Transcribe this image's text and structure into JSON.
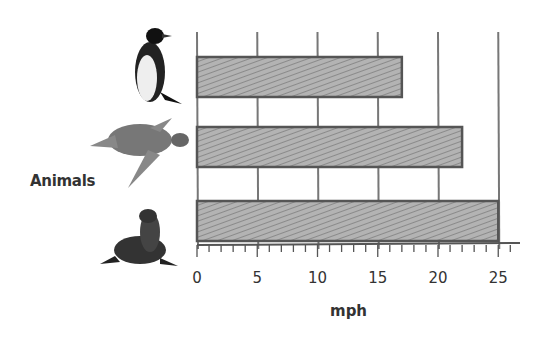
{
  "chart_data": {
    "type": "bar",
    "orientation": "horizontal",
    "title": "",
    "xlabel": "mph",
    "ylabel": "Animals",
    "categories": [
      "Penguin",
      "Sea Turtle",
      "Sea Lion"
    ],
    "category_icons": [
      "penguin-icon",
      "sea-turtle-icon",
      "sea-lion-icon"
    ],
    "values": [
      17,
      22,
      25
    ],
    "xlim": [
      0,
      25
    ],
    "xticks": [
      0,
      5,
      10,
      15,
      20,
      25
    ],
    "grid": true,
    "legend": null,
    "style": "hand-drawn pencil shading"
  },
  "labels": {
    "y_axis": "Animals",
    "x_axis": "mph"
  },
  "colors": {
    "bar_fill": "#a6a6a6",
    "bar_border": "#555555",
    "grid": "#777777",
    "text": "#333333"
  }
}
